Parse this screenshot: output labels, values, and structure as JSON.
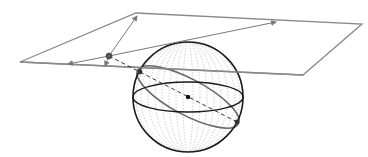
{
  "diagram": {
    "title": "",
    "colors": {
      "background": "#ffffff",
      "plane": "#8a8a8a",
      "sphere_outline": "#1a1a1a",
      "great_circle": "#6a6a6a",
      "meridians": "#b8b8b8",
      "points": "#333333",
      "dashed_line": "#333333"
    },
    "plane": {
      "corners": [
        [
          136,
          13
        ],
        [
          362,
          24
        ],
        [
          303,
          75
        ],
        [
          20,
          62
        ]
      ]
    },
    "sphere": {
      "center": [
        188,
        97
      ],
      "radius": 55,
      "equator_ry": 15
    },
    "points": {
      "plane_point": [
        109,
        56
      ],
      "sphere_point_upper": [
        140,
        72
      ],
      "sphere_point_lower": [
        237,
        122
      ],
      "center_point": [
        188,
        97
      ]
    },
    "arrows": [
      {
        "from": [
          109,
          56
        ],
        "to": [
          138,
          15
        ]
      },
      {
        "from": [
          109,
          56
        ],
        "to": [
          68,
          64
        ]
      },
      {
        "from": [
          109,
          56
        ],
        "to": [
          276,
          22
        ]
      },
      {
        "from": [
          109,
          56
        ],
        "to": [
          104,
          67
        ]
      }
    ]
  }
}
